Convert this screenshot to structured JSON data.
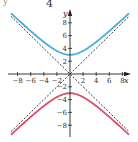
{
  "header": {
    "number_label": "4",
    "corner_mark": "y"
  },
  "chart_data": {
    "type": "line",
    "title": "",
    "xlabel": "x",
    "ylabel": "y",
    "xlim": [
      -9,
      9
    ],
    "ylim": [
      -9,
      9
    ],
    "grid": false,
    "x_ticks": [
      -8,
      -6,
      -4,
      -2,
      2,
      4,
      6,
      8
    ],
    "y_ticks": [
      -8,
      -6,
      -4,
      -2,
      2,
      4,
      6,
      8
    ],
    "x_tick_labels": [
      "-8",
      "-6",
      "-4",
      "-2",
      "2",
      "4",
      "6",
      "8"
    ],
    "y_tick_labels": [
      "-8",
      "-6",
      "-4",
      "-2",
      "2",
      "4",
      "6",
      "8"
    ],
    "series": [
      {
        "name": "upper branch",
        "equation": "y = sqrt(9 + x^2)",
        "color": "#4aaedc",
        "style": "solid",
        "x": [
          -9,
          -8,
          -6,
          -4,
          -2,
          0,
          2,
          4,
          6,
          8,
          9
        ],
        "y": [
          9.49,
          8.54,
          6.71,
          5.0,
          3.61,
          3.0,
          3.61,
          5.0,
          6.71,
          8.54,
          9.49
        ]
      },
      {
        "name": "lower branch",
        "equation": "y = -sqrt(9 + x^2)",
        "color": "#d9506e",
        "style": "solid",
        "x": [
          -9,
          -8,
          -6,
          -4,
          -2,
          0,
          2,
          4,
          6,
          8,
          9
        ],
        "y": [
          -9.49,
          -8.54,
          -6.71,
          -5.0,
          -3.61,
          -3.0,
          -3.61,
          -5.0,
          -6.71,
          -8.54,
          -9.49
        ]
      },
      {
        "name": "asymptote y = x",
        "color": "#222222",
        "style": "dashed",
        "x": [
          -9,
          9
        ],
        "y": [
          -9,
          9
        ]
      },
      {
        "name": "asymptote y = -x",
        "color": "#222222",
        "style": "dashed",
        "x": [
          -9,
          9
        ],
        "y": [
          9,
          -9
        ]
      }
    ]
  }
}
